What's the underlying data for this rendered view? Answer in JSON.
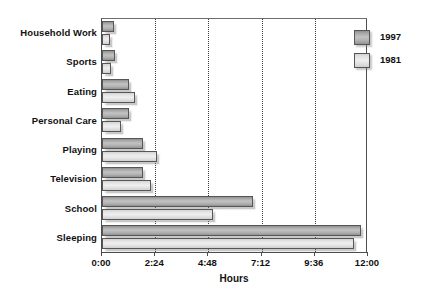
{
  "chart_data": {
    "type": "bar",
    "orientation": "horizontal",
    "title": "",
    "subtitle": "",
    "xlabel": "Hours",
    "ylabel": "",
    "categories": [
      "Household Work",
      "Sports",
      "Eating",
      "Personal Care",
      "Playing",
      "Television",
      "School",
      "Sleeping"
    ],
    "series": [
      {
        "name": "1997",
        "color": "#a8a8a8",
        "values": [
          0.55,
          0.6,
          1.2,
          1.2,
          1.85,
          1.85,
          6.8,
          11.7
        ]
      },
      {
        "name": "1981",
        "color": "#e2e2e2",
        "values": [
          0.35,
          0.4,
          1.5,
          0.85,
          2.5,
          2.2,
          5.0,
          11.35
        ]
      }
    ],
    "xlim": [
      0,
      12
    ],
    "xticks": [
      "0:00",
      "2:24",
      "4:48",
      "7:12",
      "9:36",
      "12:00"
    ],
    "xtick_values": [
      0,
      2.4,
      4.8,
      7.2,
      9.6,
      12
    ],
    "grid": "vertical-dotted",
    "legend_position": "top-right",
    "legend_entries": [
      "1997",
      "1981"
    ]
  },
  "colors": {
    "axis": "#4d4d4d",
    "grid": "#3b3b3b",
    "text": "#111111",
    "background": "#ffffff",
    "series_1997": "#a8a8a8",
    "series_1981": "#e2e2e2"
  }
}
